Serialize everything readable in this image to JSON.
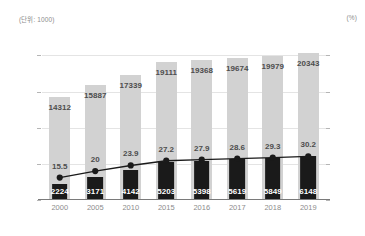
{
  "unit_left": "(단위: 1000)",
  "unit_right": "(%)",
  "chart_data": {
    "type": "bar",
    "title": "",
    "subtitle": "",
    "xlabel": "",
    "ylabel": "(단위: 1000)",
    "y2label": "(%)",
    "grid": true,
    "legend": null,
    "categories": [
      "2000",
      "2005",
      "2010",
      "2015",
      "2016",
      "2017",
      "2018",
      "2019"
    ],
    "ylim": [
      0,
      22000
    ],
    "y2lim": [
      0,
      110
    ],
    "yticks": [
      "0",
      "5,000",
      "10,000",
      "15,000",
      "20,000"
    ],
    "ytick_values": [
      0,
      5000,
      10000,
      15000,
      20000
    ],
    "y2ticks": [
      "0",
      "25",
      "50",
      "75",
      "100"
    ],
    "y2tick_values": [
      0,
      25,
      50,
      75,
      100
    ],
    "series": [
      {
        "name": "total",
        "type": "bar",
        "axis": "left",
        "color": "#d2d2d2",
        "values": [
          14312,
          15887,
          17339,
          19111,
          19368,
          19674,
          19979,
          20343
        ],
        "labels": [
          "14312",
          "15887",
          "17339",
          "19111",
          "19368",
          "19674",
          "19979",
          "20343"
        ]
      },
      {
        "name": "subset",
        "type": "bar",
        "axis": "left",
        "color": "#1a1a1a",
        "values": [
          2224,
          3171,
          4142,
          5203,
          5398,
          5619,
          5849,
          6148
        ],
        "labels": [
          "2224",
          "3171",
          "4142",
          "5203",
          "5398",
          "5619",
          "5849",
          "6148"
        ]
      },
      {
        "name": "ratio",
        "type": "line",
        "axis": "right",
        "color": "#1a1a1a",
        "values": [
          15.5,
          20,
          23.9,
          27.2,
          27.9,
          28.6,
          29.3,
          30.2
        ],
        "labels": [
          "15.5",
          "20",
          "23.9",
          "27.2",
          "27.9",
          "28.6",
          "29.3",
          "30.2"
        ]
      }
    ]
  }
}
